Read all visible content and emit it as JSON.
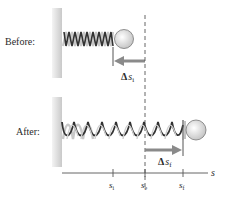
{
  "diagram": {
    "panels": {
      "before": {
        "label": "Before:"
      },
      "after": {
        "label": "After:"
      }
    },
    "displacements": {
      "initial": {
        "delta": "Δ",
        "symbol": "s",
        "subscript": "i"
      },
      "final": {
        "delta": "Δ",
        "symbol": "s",
        "subscript": "f"
      }
    },
    "axis": {
      "label": "s",
      "ticks": [
        {
          "symbol": "s",
          "subscript": "i"
        },
        {
          "symbol": "s",
          "subscript": "e"
        },
        {
          "symbol": "s",
          "subscript": "f"
        }
      ]
    },
    "colors": {
      "wall": "#d4d4d4",
      "spring_dark": "#3a3a3a",
      "spring_light": "#c8c8c8",
      "ball": "#e6e6e6",
      "arrow": "#8a8a8a",
      "line": "#555555",
      "text": "#2a2a2a"
    }
  }
}
